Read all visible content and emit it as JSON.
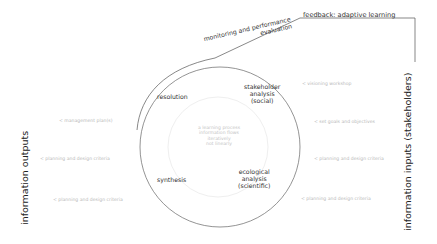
{
  "diagram": {
    "feedback_label": "feedback: adaptive learning",
    "monitoring_label_line1": "monitoring and performance",
    "monitoring_label_line2": "evaluation",
    "left_axis_label": "information outputs",
    "right_axis_label": "information inputs (stakeholders)",
    "cycle": {
      "resolution": "resolution",
      "stakeholder": [
        "stakeholder",
        "analysis",
        "(social)"
      ],
      "ecological": [
        "ecological",
        "analysis",
        "(scientific)"
      ],
      "synthesis": "synthesis"
    },
    "core": [
      "a learning process",
      "information flows",
      "iteratively",
      "not linearly"
    ],
    "outputs": [
      "< management plan(s)",
      "< planning and design criteria",
      "< planning and design criteria"
    ],
    "inputs": [
      "< visioning workshop",
      "< set goals and objectives",
      "< planning and design criteria",
      "< planning and design criteria"
    ],
    "colors": {
      "line": "#555555",
      "inner_circle": "#eeeeee",
      "faint_text": "#b8b8b8",
      "dark_text": "#333333"
    }
  }
}
